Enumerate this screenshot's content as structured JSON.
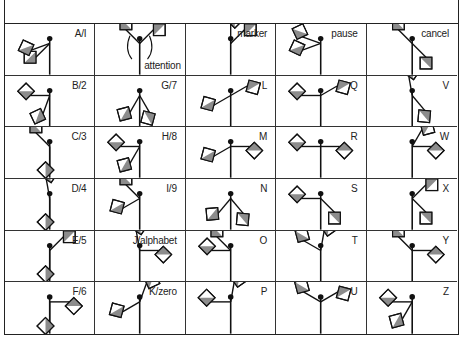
{
  "header": {
    "title": ""
  },
  "colors": {
    "line": "#111111",
    "flag_dark": "#8c8c8c",
    "flag_light": "#ffffff",
    "grid": "#333333"
  },
  "cells": [
    {
      "label": "A/I",
      "left": 225,
      "right": 200,
      "special": ""
    },
    {
      "label": "attention",
      "left": 135,
      "right": 45,
      "special": "attention",
      "label_pos": "bottom"
    },
    {
      "label": "marker",
      "left": 90,
      "right": 45,
      "special": "",
      "label_pos": "top"
    },
    {
      "label": "pause",
      "left": 200,
      "right": 160,
      "special": "pause"
    },
    {
      "label": "cancel",
      "left": 135,
      "right": 315,
      "special": ""
    },
    {
      "label": "B/2",
      "left": 180,
      "right": 250,
      "special": ""
    },
    {
      "label": "G/7",
      "left": 240,
      "right": 300,
      "special": ""
    },
    {
      "label": "L",
      "left": 210,
      "right": 30,
      "special": ""
    },
    {
      "label": "Q",
      "left": 180,
      "right": 30,
      "special": ""
    },
    {
      "label": "V",
      "left": 100,
      "right": 310,
      "special": ""
    },
    {
      "label": "C/3",
      "left": 135,
      "right": 270,
      "special": ""
    },
    {
      "label": "H/8",
      "left": 180,
      "right": 240,
      "special": ""
    },
    {
      "label": "M",
      "left": 210,
      "right": 0,
      "special": ""
    },
    {
      "label": "R",
      "left": 180,
      "right": 0,
      "special": ""
    },
    {
      "label": "W",
      "left": 60,
      "right": 0,
      "special": ""
    },
    {
      "label": "D/4",
      "left": 100,
      "right": 270,
      "special": ""
    },
    {
      "label": "I/9",
      "left": 135,
      "right": 210,
      "special": ""
    },
    {
      "label": "N",
      "left": 230,
      "right": 310,
      "special": ""
    },
    {
      "label": "S",
      "left": 180,
      "right": 315,
      "special": ""
    },
    {
      "label": "X",
      "left": 45,
      "right": 315,
      "special": ""
    },
    {
      "label": "E/5",
      "left": 45,
      "right": 270,
      "special": ""
    },
    {
      "label": "J/alphabet",
      "left": 100,
      "right": 0,
      "special": ""
    },
    {
      "label": "O",
      "left": 135,
      "right": 180,
      "special": ""
    },
    {
      "label": "T",
      "left": 150,
      "right": 80,
      "special": ""
    },
    {
      "label": "Y",
      "left": 135,
      "right": 0,
      "special": ""
    },
    {
      "label": "F/6",
      "left": 270,
      "right": 0,
      "special": ""
    },
    {
      "label": "K/zero",
      "left": 210,
      "right": 70,
      "special": ""
    },
    {
      "label": "P",
      "left": 180,
      "right": 80,
      "special": ""
    },
    {
      "label": "U",
      "left": 150,
      "right": 30,
      "special": ""
    },
    {
      "label": "Z",
      "left": 180,
      "right": 240,
      "special": ""
    }
  ]
}
